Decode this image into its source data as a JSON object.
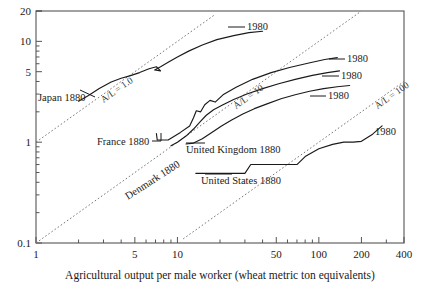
{
  "chart_data": {
    "type": "line",
    "title": "",
    "subtitle": "",
    "xlabel": "Agricultural output per male worker (wheat metric ton equivalents)",
    "ylabel": "",
    "xscale": "log",
    "yscale": "log",
    "xlim": [
      1,
      400
    ],
    "ylim": [
      0.1,
      20
    ],
    "grid": false,
    "legend_position": "inline-endpoint-labels",
    "x_tick_labels": [
      "1",
      "5",
      "10",
      "50",
      "100",
      "200",
      "400"
    ],
    "x_tick_values": [
      1,
      5,
      10,
      50,
      100,
      200,
      400
    ],
    "y_tick_labels": [
      "20",
      "10",
      "5",
      "1",
      "0.1"
    ],
    "y_tick_values": [
      20,
      10,
      5,
      1,
      0.1
    ],
    "start_label": "1880",
    "end_label": "1980",
    "series": [
      {
        "name": "Japan",
        "start_label": "Japan 1880",
        "end_label": "1980",
        "points": [
          [
            2.0,
            2.55
          ],
          [
            2.35,
            2.9
          ],
          [
            2.8,
            3.4
          ],
          [
            3.4,
            3.95
          ],
          [
            4.0,
            4.3
          ],
          [
            4.6,
            4.55
          ],
          [
            5.4,
            4.9
          ],
          [
            6.3,
            5.35
          ],
          [
            7.1,
            5.6
          ],
          [
            7.6,
            5.1
          ],
          [
            6.9,
            5.2
          ],
          [
            7.6,
            5.6
          ],
          [
            8.6,
            6.2
          ],
          [
            10.0,
            7.0
          ],
          [
            12.0,
            8.0
          ],
          [
            15.0,
            9.2
          ],
          [
            19.0,
            10.4
          ],
          [
            25.0,
            11.4
          ],
          [
            32.0,
            12.2
          ],
          [
            40.0,
            12.6
          ]
        ]
      },
      {
        "name": "France",
        "start_label": "France 1880",
        "end_label": "1980",
        "points": [
          [
            7.1,
            1.22
          ],
          [
            7.2,
            1.05
          ],
          [
            8.6,
            1.05
          ],
          [
            10.5,
            1.25
          ],
          [
            12.2,
            1.45
          ],
          [
            13.0,
            1.75
          ],
          [
            13.6,
            2.05
          ],
          [
            14.6,
            2.0
          ],
          [
            15.6,
            2.35
          ],
          [
            17.0,
            2.6
          ],
          [
            18.5,
            2.5
          ],
          [
            21.0,
            2.95
          ],
          [
            26.0,
            3.5
          ],
          [
            34.0,
            4.2
          ],
          [
            46.0,
            4.9
          ],
          [
            62.0,
            5.5
          ],
          [
            85.0,
            6.1
          ],
          [
            110.0,
            6.6
          ],
          [
            135.0,
            6.9
          ]
        ]
      },
      {
        "name": "Denmark",
        "start_label": "Denmark 1880",
        "end_label": "1980",
        "points": [
          [
            9.0,
            0.92
          ],
          [
            10.0,
            1.0
          ],
          [
            11.5,
            1.15
          ],
          [
            13.0,
            1.35
          ],
          [
            14.5,
            1.6
          ],
          [
            16.0,
            1.85
          ],
          [
            18.0,
            2.1
          ],
          [
            21.0,
            2.35
          ],
          [
            25.0,
            2.65
          ],
          [
            31.0,
            3.0
          ],
          [
            40.0,
            3.4
          ],
          [
            52.0,
            3.8
          ],
          [
            68.0,
            4.2
          ],
          [
            90.0,
            4.6
          ],
          [
            115.0,
            4.9
          ],
          [
            140.0,
            5.1
          ]
        ]
      },
      {
        "name": "United Kingdom",
        "start_label": "United Kingdom 1880",
        "end_label": "1980",
        "points": [
          [
            11.5,
            0.96
          ],
          [
            13.0,
            0.98
          ],
          [
            15.0,
            1.08
          ],
          [
            17.5,
            1.25
          ],
          [
            20.5,
            1.45
          ],
          [
            24.0,
            1.65
          ],
          [
            29.0,
            1.9
          ],
          [
            35.0,
            2.15
          ],
          [
            43.0,
            2.4
          ],
          [
            54.0,
            2.7
          ],
          [
            68.0,
            2.95
          ],
          [
            86.0,
            3.2
          ],
          [
            108.0,
            3.4
          ],
          [
            135.0,
            3.55
          ],
          [
            165.0,
            3.65
          ]
        ]
      },
      {
        "name": "United States",
        "start_label": "United States 1880",
        "end_label": "1980",
        "points": [
          [
            13.5,
            0.49
          ],
          [
            20.0,
            0.49
          ],
          [
            26.0,
            0.49
          ],
          [
            30.0,
            0.49
          ],
          [
            33.0,
            0.6
          ],
          [
            42.0,
            0.6
          ],
          [
            55.0,
            0.6
          ],
          [
            70.0,
            0.6
          ],
          [
            80.0,
            0.72
          ],
          [
            100.0,
            0.86
          ],
          [
            125.0,
            0.95
          ],
          [
            150.0,
            1.0
          ],
          [
            175.0,
            1.0
          ],
          [
            200.0,
            1.02
          ],
          [
            240.0,
            1.2
          ],
          [
            280.0,
            1.45
          ]
        ]
      }
    ],
    "reference_lines": [
      {
        "label": "A/L = 1.0",
        "ratio": 1.0
      },
      {
        "label": "A/L = 10",
        "ratio": 10
      },
      {
        "label": "A/L = 100",
        "ratio": 100
      }
    ],
    "annotations": [
      {
        "text": "Japan 1880",
        "kind": "series-start"
      },
      {
        "text": "France 1880",
        "kind": "series-start"
      },
      {
        "text": "Denmark 1880",
        "kind": "series-start"
      },
      {
        "text": "United Kingdom 1880",
        "kind": "series-start"
      },
      {
        "text": "United States 1880",
        "kind": "series-start"
      },
      {
        "text": "1980",
        "kind": "series-end"
      },
      {
        "text": "1980",
        "kind": "series-end"
      },
      {
        "text": "1980",
        "kind": "series-end"
      },
      {
        "text": "1980",
        "kind": "series-end"
      },
      {
        "text": "1980",
        "kind": "series-end"
      }
    ],
    "colors": {
      "series": "#1a1a1a",
      "reference_line": "#777777",
      "axis": "#555555",
      "background": "#ffffff"
    }
  },
  "axis": {
    "x_title": "Agricultural output per male worker (wheat metric ton equivalents)",
    "x_labels": [
      "1",
      "5",
      "10",
      "50",
      "100",
      "200",
      "400"
    ],
    "y_labels": [
      "20",
      "10",
      "5",
      "1",
      "0.1"
    ]
  },
  "labels": {
    "japan_start": "Japan 1880",
    "france_start": "France 1880",
    "denmark_start": "Denmark 1880",
    "uk_start": "United Kingdom 1880",
    "us_start": "United States 1880",
    "japan_end": "1980",
    "france_end": "1980",
    "denmark_end": "1980",
    "uk_end": "1980",
    "us_end": "1980",
    "ref_1": "A/L = 1.0",
    "ref_10": "A/L = 10",
    "ref_100": "A/L = 100"
  }
}
